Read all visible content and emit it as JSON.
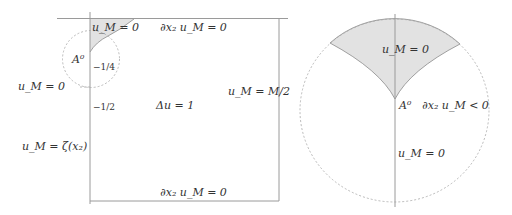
{
  "left_figure": {
    "labels": {
      "top_shaded": "u_M = 0",
      "top_boundary": "∂x₂ u_M = 0",
      "corner_point": "A⁰",
      "tick_quarter": "−1/4",
      "left_zero": "u_M = 0",
      "tick_half": "−1/2",
      "interior": "Δu = 1",
      "right_boundary": "u_M = M/2",
      "left_boundary": "u_M = ζ(x₂)",
      "bottom_boundary": "∂x₂ u_M = 0"
    }
  },
  "right_figure": {
    "labels": {
      "shaded_region": "u_M = 0",
      "point": "A⁰",
      "condition": "∂x₂ u_M < 0",
      "lower_region": "u_M = 0"
    }
  },
  "colors": {
    "line": "#9a9a9a",
    "shade": "#e2e2e2",
    "shade_edge": "#8a8a8a",
    "dashed": "#a8a8a8",
    "text": "#333333"
  }
}
